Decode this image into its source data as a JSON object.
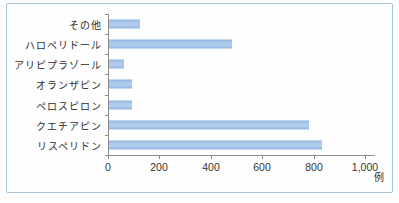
{
  "figure": {
    "background_color": "#fefefe",
    "frame_border_color": "#a6c3d9"
  },
  "chart_data": {
    "type": "bar",
    "orientation": "horizontal",
    "title": "",
    "categories": [
      "その他",
      "ハロペリドール",
      "アリピプラゾール",
      "オランザピン",
      "ペロスピロン",
      "クエチアピン",
      "リスペリドン"
    ],
    "values": [
      120,
      480,
      60,
      90,
      90,
      780,
      830
    ],
    "xlim": [
      0,
      1000
    ],
    "x_ticks": [
      0,
      200,
      400,
      600,
      800,
      1000
    ],
    "x_tick_labels": [
      "0",
      "200",
      "400",
      "600",
      "800",
      "1,000"
    ],
    "unit_label": "例",
    "bar_color": "#a3c4e7",
    "bar_edge_color": "#8fb2dc",
    "axis_color": "#8c8c8c",
    "grid": false,
    "legend": false
  }
}
